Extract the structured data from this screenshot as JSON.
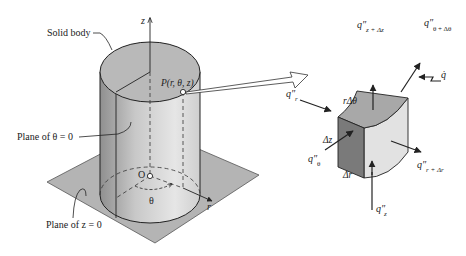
{
  "labels": {
    "solid_body": "Solid body",
    "plane_theta0": "Plane of θ = 0",
    "plane_z0": "Plane of z = 0",
    "point_p": "P(r, θ, z)",
    "origin": "O",
    "axis_z": "z",
    "axis_r": "r",
    "theta": "θ",
    "element": {
      "r_dtheta": "rΔθ",
      "dz": "Δz",
      "dr": "Δr",
      "q_r": "q″",
      "q_r_sub": "r",
      "q_theta": "q″",
      "q_theta_sub": "θ",
      "q_z": "q″",
      "q_z_sub": "z",
      "q_z_dz": "q″",
      "q_z_dz_sub": "z + Δz",
      "q_theta_dtheta": "q″",
      "q_theta_dtheta_sub": "θ + Δθ",
      "q_r_dr": "q″",
      "q_r_dr_sub": "r + Δr",
      "q_gen": "q̇"
    }
  },
  "colors": {
    "plane": "#b4b4b4",
    "cylinder_top": "#b9b9b9",
    "cylinder_side_dark": "#9a9a9a",
    "cylinder_side_light": "#dcdcdc",
    "cube_front": "#7a7a7a",
    "cube_top": "#a8a8a8",
    "cube_side": "#e2e2e2",
    "stroke": "#222222"
  }
}
